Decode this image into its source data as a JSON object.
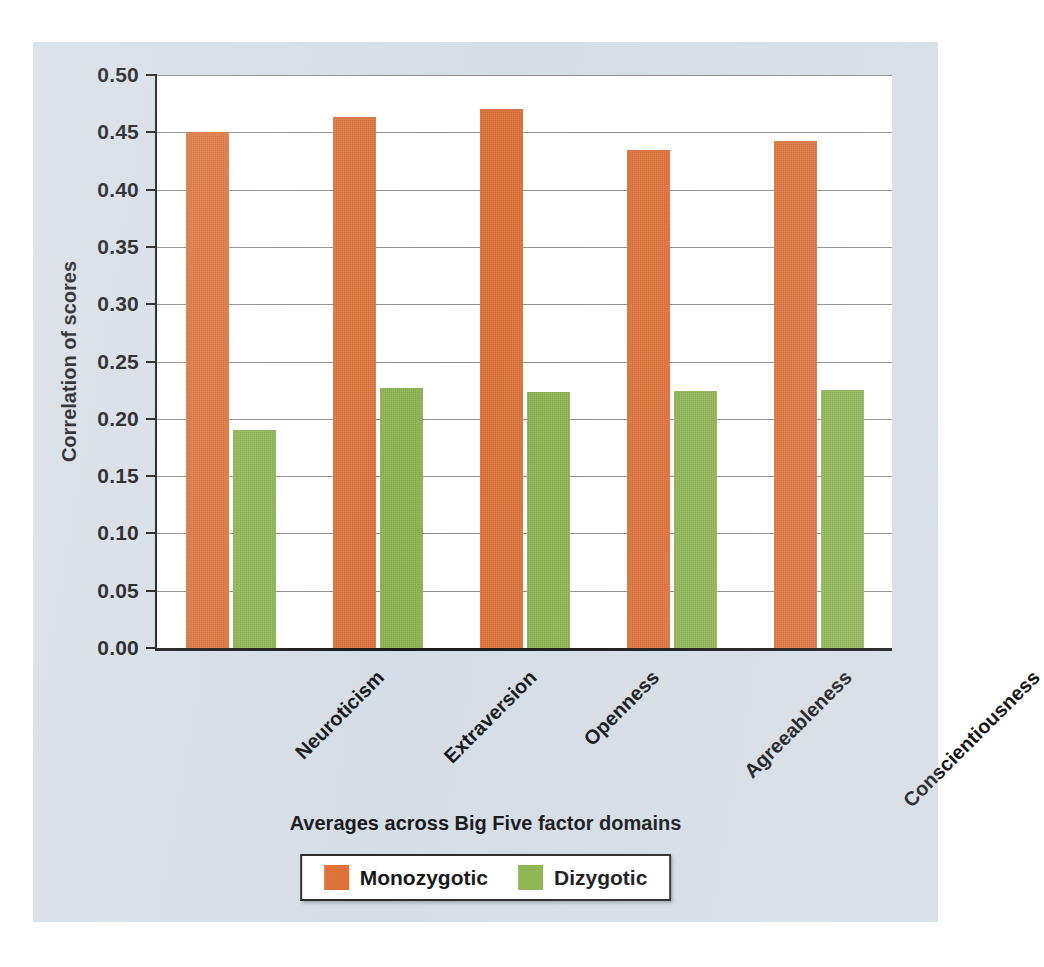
{
  "chart_data": {
    "type": "bar",
    "title": "",
    "xlabel": "Averages across Big Five factor domains",
    "ylabel": "Correlation of scores",
    "categories": [
      "Neuroticism",
      "Extraversion",
      "Openness",
      "Agreeableness",
      "Conscientiousness"
    ],
    "series": [
      {
        "name": "Monozygotic",
        "color": "#df7137",
        "values": [
          0.45,
          0.463,
          0.47,
          0.435,
          0.442
        ]
      },
      {
        "name": "Dizygotic",
        "color": "#8db44f",
        "values": [
          0.19,
          0.227,
          0.223,
          0.224,
          0.225
        ]
      }
    ],
    "ylim": [
      0.0,
      0.5
    ],
    "ytick_values": [
      0.0,
      0.05,
      0.1,
      0.15,
      0.2,
      0.25,
      0.3,
      0.35,
      0.4,
      0.45,
      0.5
    ],
    "ytick_labels": [
      "0.00",
      "0.05",
      "0.10",
      "0.15",
      "0.20",
      "0.25",
      "0.30",
      "0.35",
      "0.40",
      "0.45",
      "0.50"
    ],
    "grid": true,
    "grid_axis": "y",
    "legend_position": "bottom-center",
    "xtick_label_rotation": -45,
    "background_color": "#d5dde6",
    "plot_background_color": "#ffffff"
  },
  "legend": {
    "entries": [
      {
        "label": "Monozygotic",
        "swatch": "mz"
      },
      {
        "label": "Dizygotic",
        "swatch": "dz"
      }
    ]
  }
}
